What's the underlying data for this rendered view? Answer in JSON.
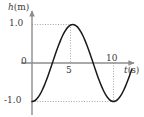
{
  "figure": {
    "name": "height-vs-time-graph",
    "background_color": "#ffffff",
    "curve_color": "#1a1a1a",
    "axis_color": "#8c8c8c",
    "guide_color": "#9a9a9a",
    "text_color": "#3b3b3b"
  },
  "labels": {
    "y_axis_var": "h",
    "y_axis_unit": "(m)",
    "x_axis_var": "t",
    "x_axis_unit": "(s)"
  },
  "ticks": {
    "y_positive": "1.0",
    "y_zero": "0",
    "y_negative": "-1.0",
    "x_five": "5",
    "x_ten": "10"
  },
  "chart_data": {
    "type": "line",
    "title": "",
    "xlabel": "t(s)",
    "ylabel": "h(m)",
    "xlim": [
      0,
      12.25
    ],
    "ylim": [
      -1.45,
      1.45
    ],
    "grid": false,
    "legend": null,
    "gridlines": {
      "horizontal": [
        {
          "y": 1.0,
          "from_x": 0,
          "to_x": 5,
          "style": "dotted"
        },
        {
          "y": -1.0,
          "from_x": 0,
          "to_x": 10,
          "style": "dotted"
        }
      ],
      "vertical": [
        {
          "x": 5,
          "from_y": 0,
          "to_y": 1.0,
          "style": "dotted"
        },
        {
          "x": 10,
          "from_y": -1.0,
          "to_y": 0,
          "style": "dotted"
        }
      ]
    },
    "annotations": [
      {
        "text": "peak",
        "x": 5,
        "y": 1.0
      },
      {
        "text": "trough",
        "x": 10,
        "y": -1.0
      }
    ],
    "series": [
      {
        "name": "h(t) = -cos(2*pi*t/10)",
        "amplitude": 1.0,
        "period": 10,
        "phase": "minimum at t=0",
        "x": [
          0,
          0.25,
          0.5,
          0.75,
          1,
          1.25,
          1.5,
          1.75,
          2,
          2.25,
          2.5,
          2.75,
          3,
          3.25,
          3.5,
          3.75,
          4,
          4.25,
          4.5,
          4.75,
          5,
          5.25,
          5.5,
          5.75,
          6,
          6.25,
          6.5,
          6.75,
          7,
          7.25,
          7.5,
          7.75,
          8,
          8.25,
          8.5,
          8.75,
          9,
          9.25,
          9.5,
          9.75,
          10,
          10.25,
          10.5,
          10.75,
          11,
          11.25,
          11.5,
          11.75,
          12,
          12.25
        ],
        "values": [
          -1.0,
          -0.988,
          -0.951,
          -0.891,
          -0.809,
          -0.707,
          -0.588,
          -0.454,
          -0.309,
          -0.156,
          0.0,
          0.156,
          0.309,
          0.454,
          0.588,
          0.707,
          0.809,
          0.891,
          0.951,
          0.988,
          1.0,
          0.988,
          0.951,
          0.891,
          0.809,
          0.707,
          0.588,
          0.454,
          0.309,
          0.156,
          0.0,
          -0.156,
          -0.309,
          -0.454,
          -0.588,
          -0.707,
          -0.809,
          -0.891,
          -0.951,
          -0.988,
          -1.0,
          -0.988,
          -0.951,
          -0.891,
          -0.809,
          -0.707,
          -0.588,
          -0.454,
          -0.309,
          -0.156
        ]
      }
    ],
    "xticks": [
      5,
      10
    ],
    "xticklabels": [
      "5",
      "10"
    ],
    "yticks": [
      1.0,
      0,
      -1.0
    ],
    "yticklabels": [
      "1.0",
      "0",
      "-1.0"
    ],
    "zero_crossings": [
      2.5,
      7.5,
      12.5
    ]
  }
}
